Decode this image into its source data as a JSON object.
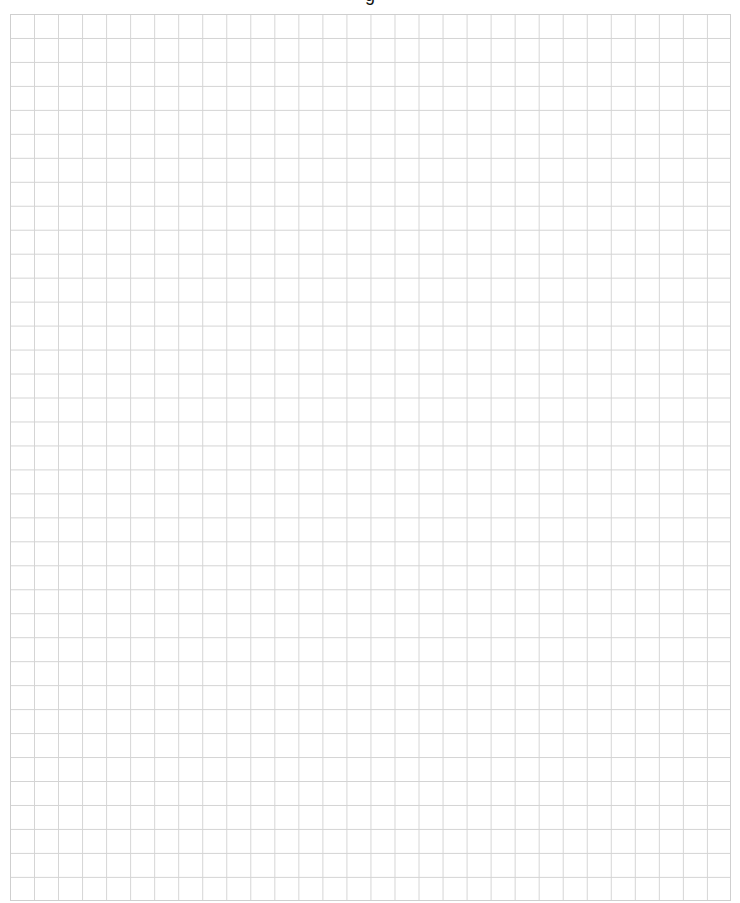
{
  "page": {
    "title_fragment": "g",
    "type": "graph-paper"
  },
  "grid": {
    "columns": 30,
    "rows": 37,
    "line_color": "#d4d4d4",
    "border_color": "#cfcfcf",
    "background": "#ffffff"
  }
}
